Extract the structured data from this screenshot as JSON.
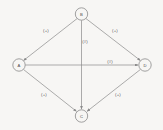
{
  "diagram": {
    "background_color": "#f7f6f4",
    "line_color": "#8a8a8a",
    "text_color": "#5a5a5a",
    "nodes": [
      {
        "id": "B",
        "label": "B",
        "cx": 81.5,
        "cy": 14,
        "r": 6.2
      },
      {
        "id": "A",
        "label": "A",
        "cx": 19,
        "cy": 65,
        "r": 6.2
      },
      {
        "id": "D",
        "label": "D",
        "cx": 145,
        "cy": 65,
        "r": 6.2
      },
      {
        "id": "C",
        "label": "C",
        "cx": 81.5,
        "cy": 116,
        "r": 6.2
      }
    ],
    "edges": [
      {
        "id": "b-a",
        "from": "B",
        "to": "A",
        "label": "(+)",
        "lx": 46,
        "ly": 30
      },
      {
        "id": "b-d",
        "from": "B",
        "to": "D",
        "label": "(+)",
        "lx": 115,
        "ly": 30
      },
      {
        "id": "b-c",
        "from": "B",
        "to": "C",
        "label": "(#)",
        "lx": 85,
        "ly": 41
      },
      {
        "id": "a-d",
        "from": "A",
        "to": "D",
        "label": "(#)",
        "lx": 110,
        "ly": 61
      },
      {
        "id": "a-c",
        "from": "A",
        "to": "C",
        "label": "(+)",
        "lx": 44,
        "ly": 94
      },
      {
        "id": "d-c",
        "from": "D",
        "to": "C",
        "label": "(+)",
        "lx": 118,
        "ly": 94
      }
    ]
  }
}
